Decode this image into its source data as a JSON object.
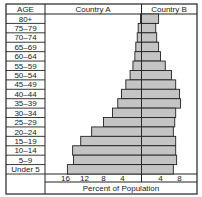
{
  "chart_data": {
    "type": "bar",
    "subtype": "population-pyramid",
    "title": "",
    "age_header": "AGE",
    "categories": [
      "80+",
      "75–79",
      "70–74",
      "65–69",
      "60–64",
      "55–59",
      "50–54",
      "45–49",
      "40–44",
      "35–39",
      "30–34",
      "25–29",
      "20–24",
      "15–19",
      "10–14",
      "5–9",
      "Under 5"
    ],
    "series": [
      {
        "name": "Country A",
        "side": "left",
        "values": [
          0.2,
          0.7,
          0.9,
          1.2,
          1.4,
          1.8,
          2.4,
          3.3,
          4.2,
          5.0,
          6.1,
          8.0,
          10.5,
          12.8,
          14.5,
          14.3,
          15.6
        ]
      },
      {
        "name": "Country B",
        "side": "right",
        "values": [
          3.6,
          3.0,
          3.2,
          3.6,
          4.0,
          5.0,
          6.3,
          7.2,
          8.0,
          8.2,
          7.2,
          7.0,
          6.7,
          7.2,
          7.2,
          7.4,
          6.7
        ]
      }
    ],
    "xlabel": "Percent of Population",
    "ylabel": "AGE",
    "left_ticks": [
      16,
      12,
      8,
      4
    ],
    "right_ticks": [
      4,
      8
    ],
    "xlim_left": [
      0,
      16.5
    ],
    "xlim_right": [
      0,
      12
    ],
    "grid": false,
    "bar_color": "#c4c4c4",
    "line_color": "#222222"
  }
}
